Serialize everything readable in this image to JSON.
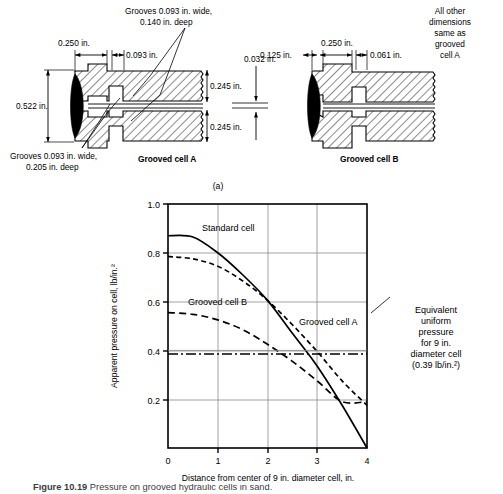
{
  "figure": {
    "part_label": "(a)",
    "diagram_a": {
      "title": "Grooved cell A",
      "dims": {
        "left_flange": "0.250 in.",
        "groove_width_note": "0.093 in.",
        "overall_height": "0.522 in.",
        "upper_thickness": "0.245 in.",
        "lower_thickness": "0.245 in."
      },
      "callout_top": [
        "Grooves 0.093 in. wide,",
        "0.140 in. deep"
      ],
      "callout_bottom": [
        "Grooves 0.093 in. wide,",
        "0.205 in. deep"
      ],
      "gap_dim": "0.032 in."
    },
    "diagram_b": {
      "title": "Grooved cell B",
      "dims": {
        "left_flange": "0.125 in.",
        "center_span": "0.250 in.",
        "right_groove": "0.061 in."
      },
      "note": [
        "All other",
        "dimensions",
        "same as",
        "grooved",
        "cell A"
      ]
    }
  },
  "chart_data": {
    "type": "line",
    "title": "",
    "xlabel": "Distance from center of 9 in. diameter cell, in.",
    "ylabel": "Apparent pressure on cell, lb/in.²",
    "xlim": [
      0,
      4
    ],
    "ylim": [
      0,
      1.0
    ],
    "xticks": [
      "0",
      "1",
      "2",
      "3",
      "4"
    ],
    "yticks": [
      "0.2",
      "0.4",
      "0.6",
      "0.8",
      "1.0"
    ],
    "grid": true,
    "legend": "inline-annotations",
    "series": [
      {
        "name": "Standard cell",
        "style": "solid",
        "x": [
          0,
          0.5,
          1.0,
          1.5,
          2.0,
          2.5,
          3.0,
          3.5,
          4.0
        ],
        "y": [
          0.87,
          0.865,
          0.8,
          0.71,
          0.605,
          0.47,
          0.335,
          0.175,
          0.0
        ]
      },
      {
        "name": "Grooved cell A",
        "style": "dashed",
        "x": [
          0,
          0.5,
          1.0,
          1.5,
          2.0,
          2.5,
          3.0,
          3.5,
          4.0
        ],
        "y": [
          0.785,
          0.775,
          0.745,
          0.685,
          0.605,
          0.505,
          0.395,
          0.275,
          0.175
        ]
      },
      {
        "name": "Grooved cell B",
        "style": "long-dashed",
        "x": [
          0,
          0.5,
          1.0,
          1.5,
          2.0,
          2.5,
          3.0,
          3.5,
          4.0
        ],
        "y": [
          0.555,
          0.548,
          0.525,
          0.485,
          0.425,
          0.355,
          0.275,
          0.19,
          0.19
        ]
      },
      {
        "name": "Equivalent uniform pressure for 9 in. diameter cell",
        "style": "dash-dot",
        "value": 0.385,
        "x": [
          0,
          4
        ],
        "y": [
          0.385,
          0.385
        ]
      }
    ],
    "annotations": [
      {
        "name": "standard-cell-label",
        "text": "Standard cell"
      },
      {
        "name": "grooved-cell-a-label",
        "text": "Grooved cell A"
      },
      {
        "name": "grooved-cell-b-label",
        "text": "Grooved cell B"
      },
      {
        "name": "equivalent-pressure-label",
        "lines": [
          "Equivalent",
          "uniform",
          "pressure",
          "for 9 in.",
          "diameter cell",
          "(0.39 lb/in.²)"
        ]
      }
    ]
  },
  "caption": {
    "prefix": "Figure 10.19",
    "text": "Pressure on grooved hydraulic cells in sand."
  }
}
